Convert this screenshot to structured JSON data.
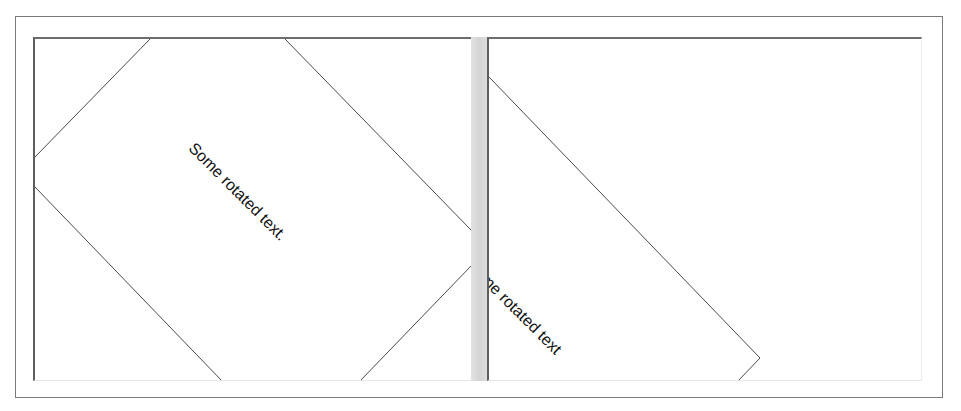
{
  "window": {
    "layout": "horizontal-split-pane",
    "colors": {
      "frame_border": "#7a7a7a",
      "panel_border_dark": "#5e5e5e",
      "splitter": "#d8d8d8",
      "shape_stroke": "#4a4a4a",
      "text": "#111111"
    }
  },
  "left_panel": {
    "text": "Some rotated text.",
    "rotation_deg": 45,
    "shape": "rotated-rectangle"
  },
  "splitter": {
    "orientation": "vertical"
  },
  "right_panel": {
    "text": "Some rotated text",
    "rotation_deg": 45,
    "shape": "rotated-rectangle",
    "clipped": true
  }
}
